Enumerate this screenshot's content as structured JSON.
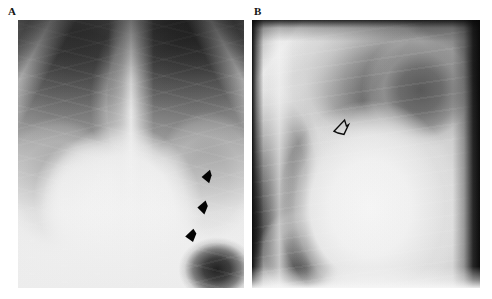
{
  "figure": {
    "type": "radiograph-figure",
    "panel_count": 2,
    "background_color": "#ffffff"
  },
  "panels": [
    {
      "label": "A",
      "name": "panel-a-pa-chest-radiograph",
      "modality": "chest radiograph",
      "view": "frontal PA",
      "annotation_style": "solid black arrowheads",
      "annotation_count": 3,
      "annotation_color": "#000000"
    },
    {
      "label": "B",
      "name": "panel-b-lateral-chest-radiograph",
      "modality": "chest radiograph",
      "view": "lateral",
      "annotation_style": "open outlined arrowhead",
      "annotation_count": 1,
      "annotation_color": "#000000"
    }
  ],
  "markers": {
    "panel_a": [
      {
        "name": "arrowhead-1",
        "shape": "solid-arrowhead",
        "direction": "left"
      },
      {
        "name": "arrowhead-2",
        "shape": "solid-arrowhead",
        "direction": "left"
      },
      {
        "name": "arrowhead-3",
        "shape": "solid-arrowhead",
        "direction": "left"
      }
    ],
    "panel_b": [
      {
        "name": "open-arrowhead-1",
        "shape": "open-arrowhead",
        "direction": "up-right"
      }
    ]
  }
}
